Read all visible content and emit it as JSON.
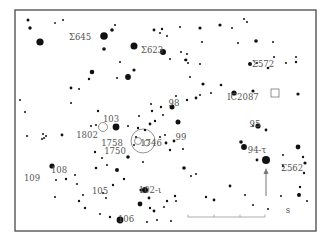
{
  "chart": {
    "type": "star-finder-chart",
    "frame": {
      "x": 15,
      "y": 10,
      "w": 301,
      "h": 221,
      "color": "#555555"
    },
    "star_color": "#111111",
    "label_color": "#555555",
    "labels": [
      {
        "id": "sigma-645",
        "text": "Σ645",
        "x": 80,
        "y": 40
      },
      {
        "id": "sigma-623",
        "text": "Σ623",
        "x": 152,
        "y": 53
      },
      {
        "id": "sigma-572",
        "text": "Σ572",
        "x": 263,
        "y": 67
      },
      {
        "id": "ic2087",
        "text": "IC2087",
        "x": 243,
        "y": 100
      },
      {
        "id": "star-98",
        "text": "98",
        "x": 174,
        "y": 106
      },
      {
        "id": "star-103",
        "text": "103",
        "x": 111,
        "y": 122
      },
      {
        "id": "star-95",
        "text": "95",
        "x": 255,
        "y": 127
      },
      {
        "id": "ngc-1802",
        "text": "1802",
        "x": 87,
        "y": 138
      },
      {
        "id": "star-99",
        "text": "99",
        "x": 181,
        "y": 140
      },
      {
        "id": "ngc-1758",
        "text": "1758",
        "x": 112,
        "y": 146
      },
      {
        "id": "ngc-1746",
        "text": "1746",
        "x": 151,
        "y": 146
      },
      {
        "id": "star-94-tau",
        "text": "94-τ",
        "x": 257,
        "y": 153
      },
      {
        "id": "ngc-1750",
        "text": "1750",
        "x": 115,
        "y": 154
      },
      {
        "id": "sigma-562",
        "text": "Σ562",
        "x": 292,
        "y": 171
      },
      {
        "id": "star-108",
        "text": "108",
        "x": 59,
        "y": 173
      },
      {
        "id": "star-109",
        "text": "109",
        "x": 32,
        "y": 181
      },
      {
        "id": "star-105",
        "text": "105",
        "x": 100,
        "y": 194
      },
      {
        "id": "star-102-iota",
        "text": "102-ι",
        "x": 150,
        "y": 193
      },
      {
        "id": "star-106",
        "text": "106",
        "x": 126,
        "y": 222
      },
      {
        "id": "scale-s",
        "text": "s",
        "x": 288,
        "y": 213
      }
    ],
    "stars": [
      [
        28,
        20,
        1.5
      ],
      [
        30,
        28,
        1.7
      ],
      [
        55,
        23,
        0.9
      ],
      [
        63,
        20,
        1.0
      ],
      [
        40,
        42,
        3.6
      ],
      [
        104,
        36,
        3.8
      ],
      [
        112,
        30,
        1.8
      ],
      [
        115,
        25,
        1.0
      ],
      [
        104,
        49,
        1.8
      ],
      [
        134,
        46,
        3.5
      ],
      [
        163,
        52,
        3.0
      ],
      [
        170,
        59,
        1.0
      ],
      [
        167,
        36,
        1.0
      ],
      [
        154,
        30,
        1.4
      ],
      [
        160,
        33,
        1.0
      ],
      [
        162,
        29,
        1.2
      ],
      [
        200,
        28,
        1.6
      ],
      [
        220,
        25,
        1.6
      ],
      [
        244,
        19,
        1.0
      ],
      [
        247,
        22,
        1.0
      ],
      [
        256,
        41,
        1.8
      ],
      [
        238,
        43,
        1.0
      ],
      [
        257,
        63,
        1.0
      ],
      [
        250,
        64,
        2.0
      ],
      [
        200,
        64,
        1.0
      ],
      [
        188,
        63,
        1.0
      ],
      [
        203,
        84,
        1.6
      ],
      [
        176,
        96,
        1.0
      ],
      [
        211,
        93,
        1.0
      ],
      [
        221,
        85,
        1.3
      ],
      [
        253,
        91,
        1.6
      ],
      [
        234,
        93,
        2.6
      ],
      [
        190,
        77,
        1.0
      ],
      [
        186,
        60,
        1.4
      ],
      [
        187,
        54,
        1.0
      ],
      [
        181,
        52,
        1.0
      ],
      [
        202,
        42,
        1.0
      ],
      [
        120,
        62,
        1.0
      ],
      [
        134,
        70,
        1.6
      ],
      [
        128,
        77,
        2.9
      ],
      [
        117,
        78,
        1.0
      ],
      [
        92,
        72,
        2.3
      ],
      [
        89,
        79,
        1.2
      ],
      [
        71,
        88,
        1.4
      ],
      [
        79,
        89,
        1.0
      ],
      [
        71,
        103,
        1.0
      ],
      [
        98,
        111,
        1.2
      ],
      [
        152,
        111,
        1.2
      ],
      [
        161,
        107,
        1.2
      ],
      [
        151,
        104,
        1.0
      ],
      [
        172,
        107,
        2.5
      ],
      [
        178,
        122,
        2.5
      ],
      [
        187,
        100,
        1.2
      ],
      [
        196,
        98,
        1.4
      ],
      [
        200,
        95,
        1.0
      ],
      [
        163,
        115,
        1.0
      ],
      [
        150,
        124,
        1.4
      ],
      [
        155,
        121,
        1.2
      ],
      [
        136,
        137,
        1.0
      ],
      [
        145,
        130,
        1.2
      ],
      [
        138,
        128,
        1.2
      ],
      [
        139,
        116,
        1.0
      ],
      [
        128,
        126,
        1.0
      ],
      [
        134,
        145,
        1.0
      ],
      [
        128,
        157,
        1.8
      ],
      [
        143,
        162,
        1.0
      ],
      [
        160,
        137,
        1.0
      ],
      [
        165,
        135,
        1.0
      ],
      [
        166,
        143,
        1.4
      ],
      [
        174,
        141,
        1.4
      ],
      [
        183,
        149,
        1.0
      ],
      [
        170,
        150,
        1.2
      ],
      [
        184,
        168,
        1.8
      ],
      [
        191,
        176,
        1.0
      ],
      [
        196,
        174,
        1.0
      ],
      [
        206,
        197,
        1.2
      ],
      [
        214,
        200,
        1.4
      ],
      [
        258,
        126,
        2.6
      ],
      [
        266,
        130,
        1.4
      ],
      [
        253,
        126,
        1.0
      ],
      [
        241,
        142,
        1.8
      ],
      [
        244,
        147,
        2.9
      ],
      [
        266,
        160,
        4.0
      ],
      [
        257,
        160,
        1.4
      ],
      [
        283,
        155,
        1.0
      ],
      [
        283,
        166,
        1.2
      ],
      [
        298,
        147,
        2.4
      ],
      [
        303,
        157,
        1.2
      ],
      [
        305,
        163,
        1.6
      ],
      [
        304,
        173,
        1.2
      ],
      [
        300,
        187,
        1.2
      ],
      [
        299,
        194,
        1.0
      ],
      [
        299,
        195,
        2.0
      ],
      [
        307,
        201,
        1.0
      ],
      [
        281,
        196,
        1.0
      ],
      [
        268,
        209,
        1.0
      ],
      [
        230,
        186,
        1.4
      ],
      [
        245,
        195,
        1.0
      ],
      [
        253,
        205,
        1.0
      ],
      [
        43,
        134,
        1.0
      ],
      [
        44,
        138,
        1.0
      ],
      [
        52,
        166,
        2.6
      ],
      [
        62,
        135,
        1.4
      ],
      [
        91,
        126,
        1.0
      ],
      [
        96,
        125,
        1.0
      ],
      [
        116,
        127,
        3.4
      ],
      [
        77,
        184,
        1.0
      ],
      [
        66,
        179,
        1.2
      ],
      [
        56,
        180,
        1.0
      ],
      [
        75,
        175,
        1.0
      ],
      [
        55,
        197,
        1.0
      ],
      [
        79,
        201,
        1.2
      ],
      [
        85,
        208,
        1.2
      ],
      [
        25,
        112,
        1.0
      ],
      [
        27,
        136,
        1.0
      ],
      [
        46,
        136,
        1.0
      ],
      [
        42,
        139,
        1.0
      ],
      [
        95,
        152,
        1.2
      ],
      [
        102,
        158,
        1.0
      ],
      [
        107,
        165,
        1.0
      ],
      [
        96,
        168,
        1.3
      ],
      [
        103,
        193,
        1.0
      ],
      [
        106,
        198,
        1.0
      ],
      [
        117,
        170,
        2.0
      ],
      [
        124,
        179,
        1.2
      ],
      [
        113,
        185,
        1.2
      ],
      [
        141,
        190,
        1.6
      ],
      [
        145,
        190,
        3.0
      ],
      [
        140,
        204,
        2.4
      ],
      [
        149,
        198,
        1.4
      ],
      [
        150,
        208,
        1.2
      ],
      [
        154,
        211,
        1.4
      ],
      [
        164,
        207,
        1.0
      ],
      [
        83,
        195,
        1.0
      ],
      [
        100,
        214,
        1.0
      ],
      [
        110,
        217,
        1.2
      ],
      [
        120,
        220,
        3.4
      ],
      [
        147,
        222,
        1.0
      ],
      [
        157,
        220,
        1.0
      ],
      [
        171,
        221,
        1.0
      ],
      [
        167,
        201,
        1.2
      ],
      [
        175,
        196,
        1.2
      ],
      [
        176,
        201,
        1.0
      ],
      [
        20,
        100,
        1.0
      ],
      [
        185,
        60,
        1.0
      ],
      [
        180,
        27,
        1.0
      ],
      [
        232,
        28,
        1.0
      ],
      [
        273,
        42,
        1.0
      ],
      [
        296,
        62,
        1.2
      ],
      [
        298,
        94,
        1.6
      ],
      [
        296,
        57,
        1.0
      ],
      [
        286,
        63,
        1.0
      ],
      [
        274,
        57,
        1.0
      ],
      [
        268,
        68,
        1.3
      ]
    ],
    "open_circles": [
      {
        "id": "ngc-1802-circle",
        "x": 103,
        "y": 127,
        "r": 4.5
      },
      {
        "id": "ngc-1758-circle",
        "x": 138,
        "y": 141,
        "r": 3.5
      },
      {
        "id": "ngc-1758-inner",
        "x": 147,
        "y": 143,
        "r": 3.0
      },
      {
        "id": "ngc-1746-circle",
        "x": 143,
        "y": 141,
        "r": 12
      }
    ],
    "squares": [
      {
        "id": "ic2087-square",
        "x": 275,
        "y": 93,
        "size": 8
      }
    ],
    "arrow": {
      "from": [
        266,
        196
      ],
      "to": [
        266,
        168
      ],
      "color": "#777777"
    },
    "scale_bar": {
      "x1": 188,
      "x2": 265,
      "y": 217,
      "ticks": [
        188,
        214,
        240,
        265
      ],
      "color": "#999999"
    }
  }
}
